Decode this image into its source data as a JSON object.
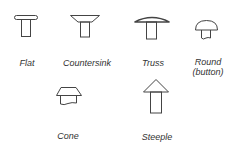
{
  "items": [
    {
      "name": "flat",
      "label": "Flat"
    },
    {
      "name": "countersink",
      "label": "Countersink"
    },
    {
      "name": "truss",
      "label": "Truss"
    },
    {
      "name": "round",
      "label": "Round",
      "sublabel": "(button)"
    },
    {
      "name": "cone",
      "label": "Cone"
    },
    {
      "name": "steeple",
      "label": "Steeple"
    }
  ],
  "colors": {
    "stroke": "#444444",
    "text": "#333333",
    "background": "#ffffff"
  }
}
